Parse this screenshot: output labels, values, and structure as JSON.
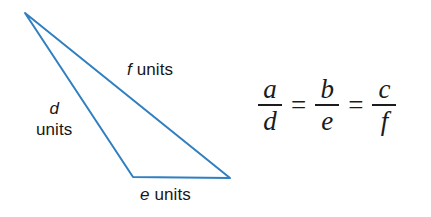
{
  "figure": {
    "type": "geometry-diagram",
    "shape": "triangle",
    "stroke_color": "#2f7fc1",
    "stroke_width": 2,
    "background": "#ffffff",
    "text_color": "#171717",
    "vertices": [
      {
        "name": "apex",
        "x": 25,
        "y": 13
      },
      {
        "name": "bottom-left",
        "x": 133,
        "y": 177
      },
      {
        "name": "bottom-right",
        "x": 230,
        "y": 178
      }
    ],
    "labels": {
      "side_d": {
        "var": "d",
        "units": "units"
      },
      "side_e": {
        "var": "e",
        "units": "units"
      },
      "side_f": {
        "var": "f",
        "units": "units"
      }
    }
  },
  "equation": {
    "text": "a/d = b/e = c/f",
    "fractions": [
      {
        "numerator": "a",
        "denominator": "d"
      },
      {
        "numerator": "b",
        "denominator": "e"
      },
      {
        "numerator": "c",
        "denominator": "f"
      }
    ],
    "operator": "=",
    "color": "#1b1b20"
  }
}
